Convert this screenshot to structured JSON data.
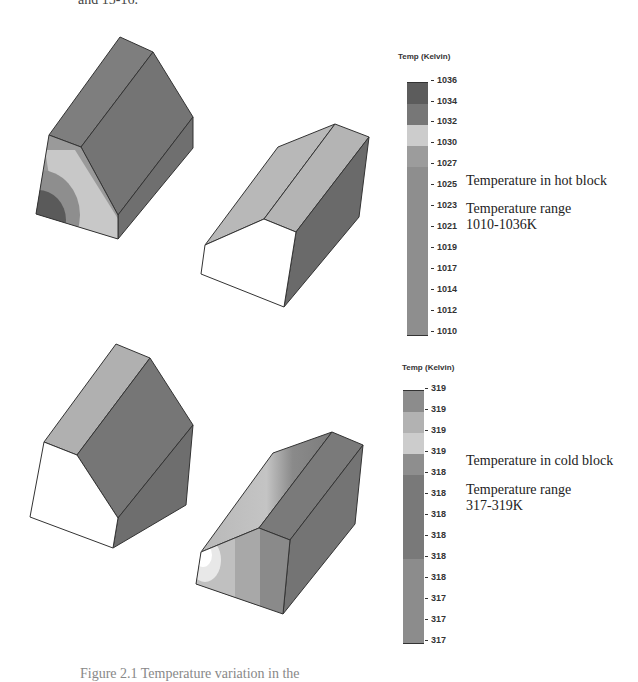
{
  "page": {
    "top_fragment": "and 15-16.",
    "bottom_fragment": "Figure 2.1 Temperature variation in the"
  },
  "hot": {
    "colorbar_title": "Temp (Kelvin)",
    "ticks": [
      "1036",
      "1034",
      "1032",
      "1030",
      "1027",
      "1025",
      "1023",
      "1021",
      "1019",
      "1017",
      "1014",
      "1012",
      "1010"
    ],
    "segments": [
      "#5a5a5a",
      "#7a7a7a",
      "#cfcfcf",
      "#9a9a9a",
      "#8a8a8a",
      "#8c8c8c",
      "#8e8e8e",
      "#909090",
      "#929292",
      "#939393",
      "#959595",
      "#969696"
    ],
    "label": "Temperature in hot block",
    "range_title": "Temperature range",
    "range_value": "1010-1036K"
  },
  "cold": {
    "colorbar_title": "Temp (Kelvin)",
    "ticks": [
      "319",
      "319",
      "319",
      "319",
      "318",
      "318",
      "318",
      "318",
      "318",
      "318",
      "317",
      "317",
      "317"
    ],
    "segments": [
      "#8c8c8c",
      "#b4b4b4",
      "#cdcdcd",
      "#8e8e8e",
      "#787878",
      "#7d7d7d",
      "#828282",
      "#878787",
      "#8c8c8c",
      "#909090",
      "#949494",
      "#989898"
    ],
    "label": "Temperature in cold block",
    "range_title": "Temperature range",
    "range_value": "317-319K"
  }
}
